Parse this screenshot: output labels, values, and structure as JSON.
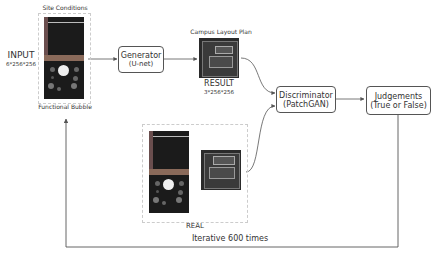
{
  "input": {
    "top_label": "Site Conditions",
    "bottom_label": "Functional Bubble",
    "title": "INPUT",
    "dims": "6*256*256"
  },
  "generator": {
    "title": "Generator",
    "subtitle": "(U-net)"
  },
  "result": {
    "top_label": "Campus Layout Plan",
    "title": "RESULT",
    "dims": "3*256*256"
  },
  "discriminator": {
    "title": "Discriminator",
    "subtitle": "(PatchGAN)"
  },
  "judgements": {
    "title": "Judgements",
    "subtitle": "(True or False)"
  },
  "real": {
    "label": "REAL"
  },
  "loop": {
    "label": "Iterative 600 times"
  },
  "colors": {
    "line": "#555555",
    "box_border": "#555555",
    "image_dark": "#1b1b1b",
    "site_band": "#8a6a5a"
  }
}
